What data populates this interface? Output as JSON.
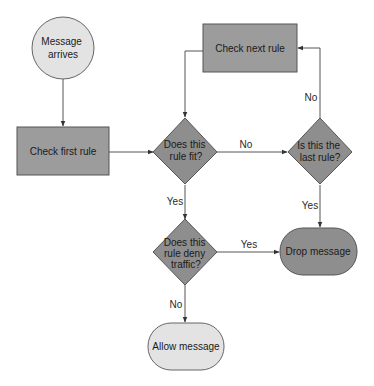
{
  "diagram": {
    "type": "flowchart",
    "colors": {
      "start_fill": "#e3e3e3",
      "process_fill": "#9c9c9c",
      "decision_fill": "#8e8e8e",
      "terminal_drop_fill": "#8e8e8e",
      "terminal_allow_fill": "#e3e3e3",
      "stroke": "#555555",
      "edge": "#444444"
    },
    "nodes": {
      "message_arrives": {
        "shape": "circle",
        "lines": [
          "Message",
          "arrives"
        ]
      },
      "check_first_rule": {
        "shape": "rectangle",
        "lines": [
          "Check first rule"
        ]
      },
      "rule_fit": {
        "shape": "diamond",
        "lines": [
          "Does this",
          "rule fit?"
        ]
      },
      "check_next_rule": {
        "shape": "rectangle",
        "lines": [
          "Check next rule"
        ]
      },
      "last_rule": {
        "shape": "diamond",
        "lines": [
          "Is this the",
          "last rule?"
        ]
      },
      "rule_deny": {
        "shape": "diamond",
        "lines": [
          "Does this",
          "rule deny",
          "traffic?"
        ]
      },
      "drop_message": {
        "shape": "terminal",
        "lines": [
          "Drop message"
        ]
      },
      "allow_message": {
        "shape": "terminal",
        "lines": [
          "Allow message"
        ]
      }
    },
    "edges": [
      {
        "from": "message_arrives",
        "to": "check_first_rule",
        "label": ""
      },
      {
        "from": "check_first_rule",
        "to": "rule_fit",
        "label": ""
      },
      {
        "from": "rule_fit",
        "to": "last_rule",
        "label": "No"
      },
      {
        "from": "last_rule",
        "to": "check_next_rule",
        "label": "No"
      },
      {
        "from": "check_next_rule",
        "to": "rule_fit",
        "label": ""
      },
      {
        "from": "last_rule",
        "to": "drop_message",
        "label": "Yes"
      },
      {
        "from": "rule_fit",
        "to": "rule_deny",
        "label": "Yes"
      },
      {
        "from": "rule_deny",
        "to": "drop_message",
        "label": "Yes"
      },
      {
        "from": "rule_deny",
        "to": "allow_message",
        "label": "No"
      }
    ],
    "edge_labels": {
      "fit_no": "No",
      "last_no": "No",
      "last_yes": "Yes",
      "fit_yes": "Yes",
      "deny_yes": "Yes",
      "deny_no": "No"
    }
  }
}
